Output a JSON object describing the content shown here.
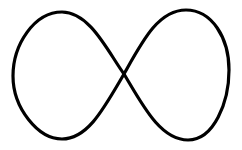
{
  "figure": {
    "shape": "infinity-symbol",
    "background": "#ffffff",
    "stroke_color": "#000000",
    "stroke_width": 3.2
  }
}
